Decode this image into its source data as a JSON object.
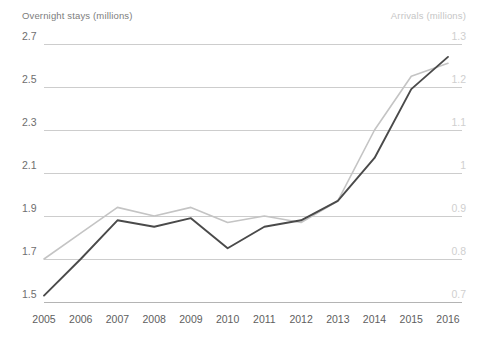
{
  "chart_data": {
    "type": "line",
    "title": "",
    "xlabel": "",
    "grid": true,
    "legend_position": "axis-titles",
    "categories": [
      2005,
      2006,
      2007,
      2008,
      2009,
      2010,
      2011,
      2012,
      2013,
      2014,
      2015,
      2016
    ],
    "x_tick_labels": [
      "2005",
      "2006",
      "2007",
      "2008",
      "2009",
      "2010",
      "2011",
      "2012",
      "2013",
      "2014",
      "2015",
      "2016"
    ],
    "axes": {
      "left": {
        "label": "Overnight stays (millions)",
        "ylim": [
          1.5,
          2.7
        ],
        "ticks": [
          2.7,
          2.5,
          2.3,
          2.1,
          1.9,
          1.7,
          1.5
        ],
        "tick_labels": [
          "2.7",
          "2.5",
          "2.3",
          "2.1",
          "1.9",
          "1.7",
          "1.5"
        ],
        "color": "#6e6e6e"
      },
      "right": {
        "label": "Arrivals (millions)",
        "ylim": [
          0.7,
          1.3
        ],
        "ticks": [
          1.3,
          1.2,
          1.1,
          1.0,
          0.9,
          0.8,
          0.7
        ],
        "tick_labels": [
          "1.3",
          "1.2",
          "1.1",
          "1",
          "0.9",
          "0.8",
          "0.7"
        ],
        "color": "#cfcfcf"
      }
    },
    "series": [
      {
        "name": "Overnight stays (millions)",
        "axis": "left",
        "color": "#4a4a4a",
        "stroke_width": 1.9,
        "values": [
          1.53,
          1.7,
          1.88,
          1.85,
          1.89,
          1.75,
          1.85,
          1.88,
          1.97,
          2.17,
          2.49,
          2.64
        ]
      },
      {
        "name": "Arrivals (millions)",
        "axis": "right",
        "color": "#c4c4c4",
        "stroke_width": 1.6,
        "values": [
          0.8,
          0.86,
          0.92,
          0.9,
          0.92,
          0.885,
          0.9,
          0.885,
          0.935,
          1.1,
          1.225,
          1.255
        ]
      }
    ]
  },
  "colors": {
    "background": "#ffffff",
    "gridline": "#cdcdcd",
    "axis_line": "#b4b4b4",
    "series_dark": "#4a4a4a",
    "series_light": "#c4c4c4"
  }
}
